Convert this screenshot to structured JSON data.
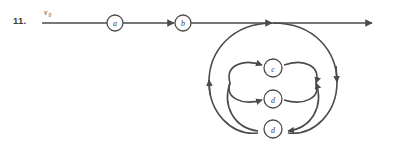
{
  "figure": {
    "item_number": "11.",
    "stroke_color": "#4b4b4b",
    "node_fill": "#ffffff",
    "background": "#ffffff",
    "start_label": "v",
    "start_label_subscript": "0",
    "nodes": [
      {
        "id": "a",
        "label": "a",
        "cx": 115,
        "cy": 23,
        "r": 8
      },
      {
        "id": "b",
        "label": "b",
        "cx": 183,
        "cy": 23,
        "r": 8
      },
      {
        "id": "c",
        "label": "c",
        "cx": 273,
        "cy": 68,
        "r": 9
      },
      {
        "id": "d1",
        "label": "d",
        "cx": 273,
        "cy": 99,
        "r": 9
      },
      {
        "id": "d2",
        "label": "d",
        "cx": 273,
        "cy": 129,
        "r": 9
      }
    ],
    "main_line": {
      "x_start": 42,
      "x_end": 374,
      "y": 23
    }
  }
}
